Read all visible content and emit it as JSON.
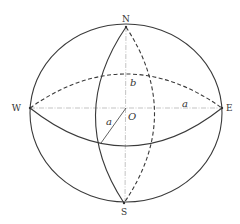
{
  "diagram": {
    "type": "ellipsoid",
    "colors": {
      "line": "#3a3a3a",
      "axis": "#9a9a9a",
      "text": "#333333",
      "background": "#ffffff"
    },
    "points": {
      "north": {
        "label": "N"
      },
      "south": {
        "label": "S"
      },
      "west": {
        "label": "W"
      },
      "east": {
        "label": "E"
      },
      "center": {
        "label": "O"
      }
    },
    "dimensions": {
      "semi_axis_b": {
        "label": "b"
      },
      "semi_axis_a_horizontal": {
        "label": "a"
      },
      "semi_axis_a_radius": {
        "label": "a"
      }
    }
  }
}
